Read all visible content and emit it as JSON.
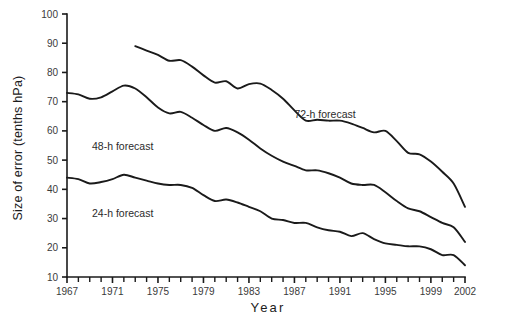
{
  "chart_data": {
    "type": "line",
    "title": "",
    "xlabel": "Year",
    "ylabel": "Size of error (tenths hPa)",
    "xlim": [
      1967,
      2002
    ],
    "ylim": [
      10,
      100
    ],
    "grid": false,
    "legend_position": "inline-annotations",
    "x_tick_labels": [
      "1967",
      "1971",
      "1975",
      "1979",
      "1983",
      "1987",
      "1991",
      "1995",
      "1999",
      "2002"
    ],
    "x_tick_values": [
      1967,
      1971,
      1975,
      1979,
      1983,
      1987,
      1991,
      1995,
      1999,
      2002
    ],
    "x_minor_ticks_every": 1,
    "y_tick_labels": [
      "100",
      "90",
      "80",
      "70",
      "60",
      "50",
      "40",
      "30",
      "20",
      "10"
    ],
    "y_tick_values": [
      100,
      90,
      80,
      70,
      60,
      50,
      40,
      30,
      20,
      10
    ],
    "series": [
      {
        "name": "72-h forecast",
        "label": "72-h forecast",
        "color": "#1a1a1a",
        "x": [
          1973,
          1974,
          1975,
          1976,
          1977,
          1978,
          1979,
          1980,
          1981,
          1982,
          1983,
          1984,
          1985,
          1986,
          1987,
          1988,
          1989,
          1990,
          1991,
          1992,
          1993,
          1994,
          1995,
          1996,
          1997,
          1998,
          1999,
          2000,
          2001,
          2002
        ],
        "values": [
          89.0,
          87.5,
          86.0,
          84.0,
          84.2,
          82.0,
          79.0,
          76.5,
          77.0,
          74.5,
          76.0,
          76.2,
          74.0,
          71.0,
          67.0,
          63.5,
          63.8,
          63.5,
          63.5,
          62.5,
          61.0,
          59.5,
          60.0,
          56.5,
          52.5,
          52.0,
          49.5,
          46.0,
          42.0,
          34.0
        ]
      },
      {
        "name": "48-h forecast",
        "label": "48-h forecast",
        "color": "#1a1a1a",
        "x": [
          1967,
          1968,
          1969,
          1970,
          1971,
          1972,
          1973,
          1974,
          1975,
          1976,
          1977,
          1978,
          1979,
          1980,
          1981,
          1982,
          1983,
          1984,
          1985,
          1986,
          1987,
          1988,
          1989,
          1990,
          1991,
          1992,
          1993,
          1994,
          1995,
          1996,
          1997,
          1998,
          1999,
          2000,
          2001,
          2002
        ],
        "values": [
          73.0,
          72.5,
          71.0,
          71.5,
          73.5,
          75.5,
          74.5,
          71.5,
          68.0,
          66.0,
          66.5,
          64.5,
          62.0,
          60.0,
          61.0,
          59.5,
          57.0,
          54.0,
          51.5,
          49.5,
          48.0,
          46.5,
          46.5,
          45.5,
          44.0,
          42.0,
          41.5,
          41.5,
          39.0,
          36.0,
          33.5,
          32.5,
          30.5,
          28.5,
          27.0,
          22.0
        ]
      },
      {
        "name": "24-h forecast",
        "label": "24-h forecast",
        "color": "#1a1a1a",
        "x": [
          1967,
          1968,
          1969,
          1970,
          1971,
          1972,
          1973,
          1974,
          1975,
          1976,
          1977,
          1978,
          1979,
          1980,
          1981,
          1982,
          1983,
          1984,
          1985,
          1986,
          1987,
          1988,
          1989,
          1990,
          1991,
          1992,
          1993,
          1994,
          1995,
          1996,
          1997,
          1998,
          1999,
          2000,
          2001,
          2002
        ],
        "values": [
          44.0,
          43.5,
          42.0,
          42.5,
          43.5,
          45.0,
          44.0,
          43.0,
          42.0,
          41.5,
          41.5,
          40.5,
          38.0,
          36.0,
          36.5,
          35.5,
          34.0,
          32.5,
          30.0,
          29.5,
          28.5,
          28.5,
          27.0,
          26.0,
          25.5,
          24.0,
          25.0,
          23.0,
          21.5,
          21.0,
          20.5,
          20.5,
          19.5,
          17.5,
          17.5,
          14.0
        ]
      }
    ],
    "annotations": [
      {
        "text": "72-h forecast",
        "x": 1987.0,
        "y": 64.5
      },
      {
        "text": "48-h forecast",
        "x": 1969.2,
        "y": 53.5
      },
      {
        "text": "24-h forecast",
        "x": 1969.2,
        "y": 30.5
      }
    ]
  }
}
